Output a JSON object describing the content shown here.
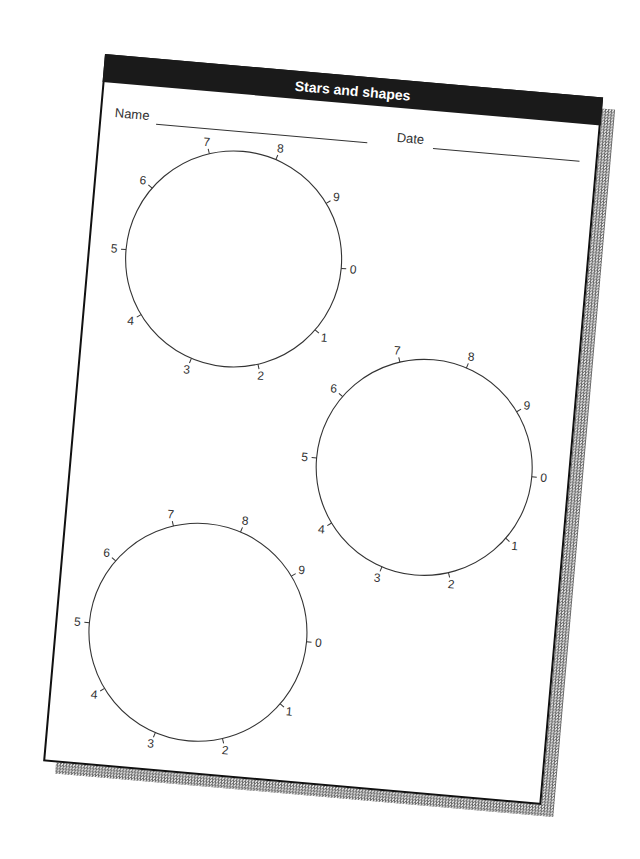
{
  "worksheet": {
    "title": "Stars and shapes",
    "name_label": "Name",
    "date_label": "Date"
  },
  "dials": [
    {
      "id": "dial-1",
      "cx": 144,
      "cy": 191,
      "r": 108,
      "labels": [
        "0",
        "1",
        "2",
        "3",
        "4",
        "5",
        "6",
        "7",
        "8",
        "9"
      ]
    },
    {
      "id": "dial-2",
      "cx": 352,
      "cy": 382,
      "r": 108,
      "labels": [
        "0",
        "1",
        "2",
        "3",
        "4",
        "5",
        "6",
        "7",
        "8",
        "9"
      ]
    },
    {
      "id": "dial-3",
      "cx": 141,
      "cy": 566,
      "r": 109,
      "labels": [
        "0",
        "1",
        "2",
        "3",
        "4",
        "5",
        "6",
        "7",
        "8",
        "9"
      ]
    }
  ],
  "colors": {
    "ink": "#333333",
    "header_bg": "#1a1a1a",
    "header_text": "#ffffff"
  }
}
